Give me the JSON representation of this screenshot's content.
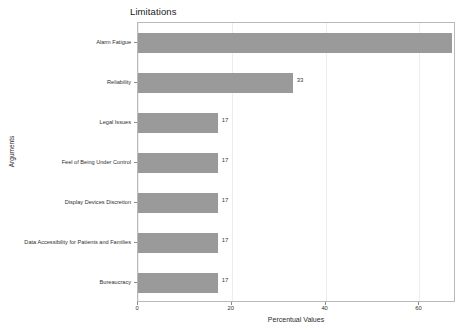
{
  "chart_data": {
    "type": "bar",
    "orientation": "horizontal",
    "title": "Limitations",
    "xlabel": "Percentual Values",
    "ylabel": "Arguments",
    "categories": [
      "Alarm Fatigue",
      "Reliability",
      "Legal Issues",
      "Feel of Being Under Control",
      "Display Devices Discretion",
      "Data Accessibility for Patients and Families",
      "Bureaucracy"
    ],
    "values": [
      67,
      33,
      17,
      17,
      17,
      17,
      17
    ],
    "value_labels": [
      "67",
      "33",
      "17",
      "17",
      "17",
      "17",
      "17"
    ],
    "xlim": [
      0,
      67.8
    ],
    "xticks": [
      0,
      20,
      40,
      60
    ],
    "xtick_labels": [
      "0",
      "20",
      "40",
      "60"
    ],
    "grid": true,
    "grid_axis": "x",
    "legend": false,
    "bar_color": "#9a9a9a",
    "grid_color": "#ededed",
    "frame_color": "#b9b9b9",
    "text_color": "#2f2f2f"
  }
}
